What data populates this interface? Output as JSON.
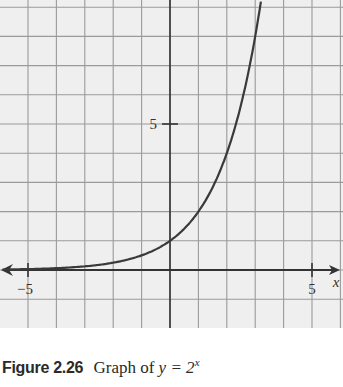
{
  "chart_data": {
    "type": "line",
    "function": "y = 2^x",
    "xlabel": "x",
    "ylabel": "",
    "xlim": [
      -6,
      6
    ],
    "ylim": [
      -2,
      9.2
    ],
    "grid": true,
    "grid_step": 1,
    "x_tick_labels": [
      {
        "value": -5,
        "label": "−5"
      },
      {
        "value": 5,
        "label": "5"
      }
    ],
    "y_tick_labels": [
      {
        "value": 5,
        "label": "5"
      }
    ],
    "series": [
      {
        "name": "y = 2^x",
        "x": [
          -6,
          -5,
          -4,
          -3,
          -2,
          -1,
          0,
          1,
          2,
          3,
          3.2
        ],
        "y": [
          0.016,
          0.031,
          0.0625,
          0.125,
          0.25,
          0.5,
          1,
          2,
          4,
          8,
          9.19
        ]
      }
    ],
    "axis_arrows": {
      "x_left": true,
      "x_right": true
    }
  },
  "caption": {
    "figure_label": "Figure 2.26",
    "text_prefix": "Graph of ",
    "equation": "y = 2",
    "exponent": "x"
  },
  "colors": {
    "background": "#efefef",
    "grid": "#9a9a9a",
    "axis": "#333333",
    "curve": "#3a3a3a"
  }
}
